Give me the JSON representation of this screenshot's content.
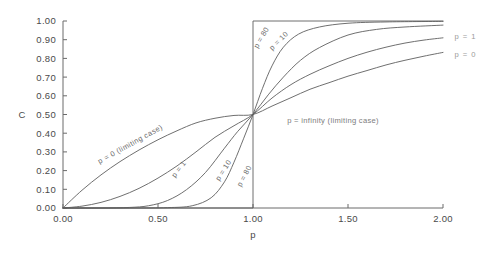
{
  "chart_data": {
    "type": "line",
    "title": "",
    "xlabel": "p",
    "ylabel": "C",
    "xlim": [
      0.0,
      2.0
    ],
    "ylim": [
      0.0,
      1.0
    ],
    "grid": false,
    "legend_position": "inline-curve-labels",
    "x_ticks": [
      "0.00",
      "0.50",
      "1.00",
      "1.50",
      "2.00"
    ],
    "x_tick_values": [
      0.0,
      0.5,
      1.0,
      1.5,
      2.0
    ],
    "y_ticks": [
      "0.00",
      "0.10",
      "0.20",
      "0.30",
      "0.40",
      "0.50",
      "0.60",
      "0.70",
      "0.80",
      "0.90",
      "1.00"
    ],
    "y_tick_values": [
      0.0,
      0.1,
      0.2,
      0.3,
      0.4,
      0.5,
      0.6,
      0.7,
      0.8,
      0.9,
      1.0
    ],
    "series": [
      {
        "name": "p = 0 (limiting case)",
        "label": "p = 0 (limiting case)",
        "x": [
          0.0,
          0.1,
          0.2,
          0.3,
          0.4,
          0.5,
          0.6,
          0.7,
          0.8,
          0.9,
          1.0,
          1.1,
          1.2,
          1.3,
          1.4,
          1.5,
          1.6,
          1.7,
          1.8,
          1.9,
          2.0
        ],
        "values": [
          0.0,
          0.095,
          0.177,
          0.248,
          0.31,
          0.365,
          0.413,
          0.455,
          0.48,
          0.495,
          0.5,
          0.545,
          0.59,
          0.635,
          0.67,
          0.705,
          0.735,
          0.765,
          0.79,
          0.812,
          0.832
        ]
      },
      {
        "name": "p = 1",
        "label": "p = 1",
        "x": [
          0.0,
          0.1,
          0.2,
          0.3,
          0.4,
          0.5,
          0.6,
          0.7,
          0.8,
          0.9,
          1.0,
          1.1,
          1.2,
          1.3,
          1.4,
          1.5,
          1.6,
          1.7,
          1.8,
          1.9,
          2.0
        ],
        "values": [
          0.0,
          0.01,
          0.03,
          0.062,
          0.105,
          0.16,
          0.225,
          0.3,
          0.378,
          0.44,
          0.5,
          0.588,
          0.66,
          0.715,
          0.76,
          0.8,
          0.833,
          0.86,
          0.882,
          0.898,
          0.91
        ]
      },
      {
        "name": "p = 10",
        "label": "p = 10",
        "x": [
          0.0,
          0.2,
          0.35,
          0.45,
          0.55,
          0.65,
          0.75,
          0.85,
          0.92,
          1.0,
          1.08,
          1.16,
          1.25,
          1.35,
          1.5,
          1.65,
          1.8,
          2.0
        ],
        "values": [
          0.0,
          0.0,
          0.003,
          0.012,
          0.04,
          0.098,
          0.19,
          0.32,
          0.41,
          0.5,
          0.605,
          0.7,
          0.79,
          0.858,
          0.925,
          0.955,
          0.968,
          0.978
        ]
      },
      {
        "name": "p = 80",
        "label": "p = 80",
        "x": [
          0.0,
          0.35,
          0.55,
          0.68,
          0.78,
          0.85,
          0.9,
          0.95,
          1.0,
          1.05,
          1.1,
          1.16,
          1.24,
          1.35,
          1.5,
          1.7,
          2.0
        ],
        "values": [
          0.0,
          0.0,
          0.002,
          0.012,
          0.055,
          0.14,
          0.245,
          0.37,
          0.5,
          0.64,
          0.76,
          0.86,
          0.93,
          0.968,
          0.988,
          0.995,
          0.998
        ]
      },
      {
        "name": "p = infinity (limiting case)",
        "label": "p = infinity (limiting case)",
        "x": [
          0.0,
          1.0,
          1.0,
          2.0
        ],
        "values": [
          0.0,
          0.0,
          1.0,
          1.0
        ]
      }
    ],
    "annotations": [
      {
        "text": "p = 0 (limiting case)",
        "x": 0.36,
        "y": 0.33,
        "rotation": -29
      },
      {
        "text": "p = 1",
        "x": 0.62,
        "y": 0.2,
        "rotation": -52
      },
      {
        "text": "p = 10",
        "x": 0.855,
        "y": 0.195,
        "rotation": -57
      },
      {
        "text": "p = 80",
        "x": 0.965,
        "y": 0.165,
        "rotation": -62
      },
      {
        "text": "p = 80",
        "x": 1.055,
        "y": 0.905,
        "rotation": -60
      },
      {
        "text": "p = 10",
        "x": 1.145,
        "y": 0.885,
        "rotation": -45
      },
      {
        "text": "p = infinity (limiting case)",
        "x": 1.18,
        "y": 0.455,
        "rotation": 0
      },
      {
        "text": "p = 1",
        "x": 2.06,
        "y": 0.905,
        "rotation": 0
      },
      {
        "text": "p = 0",
        "x": 2.06,
        "y": 0.805,
        "rotation": 0
      }
    ]
  }
}
